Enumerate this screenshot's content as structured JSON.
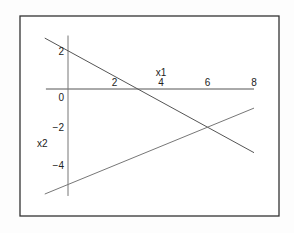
{
  "chart_data": {
    "type": "line",
    "title": "",
    "xlabel": "x1",
    "ylabel": "x2",
    "xlim": [
      -1,
      8
    ],
    "ylim": [
      -5.5,
      2.7
    ],
    "x_ticks": [
      {
        "value": 2,
        "label": "2"
      },
      {
        "value": 4,
        "label": "4"
      },
      {
        "value": 6,
        "label": "6"
      },
      {
        "value": 8,
        "label": "8"
      }
    ],
    "y_ticks": [
      {
        "value": 2,
        "label": "2"
      },
      {
        "value": 0,
        "label": "0"
      },
      {
        "value": -2,
        "label": "-2"
      },
      {
        "value": -4,
        "label": "-4"
      }
    ],
    "grid": false,
    "legend": null,
    "series": [
      {
        "name": "line1",
        "equation": "x2 = 2 - (2/3) x1",
        "x": [
          -1,
          8
        ],
        "y": [
          2.667,
          -3.333
        ],
        "color": "#555555"
      },
      {
        "name": "line2",
        "equation": "x2 = 0.5 x1 - 5",
        "x": [
          -1,
          8
        ],
        "y": [
          -5.5,
          -1
        ],
        "color": "#777777"
      }
    ],
    "intersection": {
      "x": 6,
      "y": -2
    }
  }
}
